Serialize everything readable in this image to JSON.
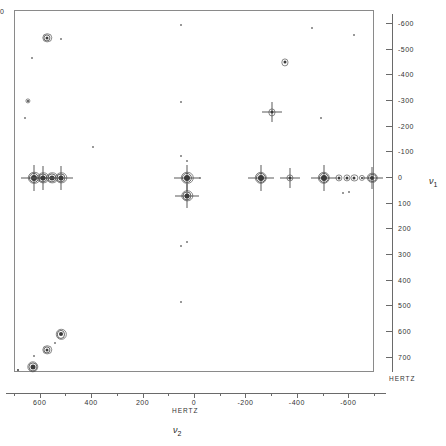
{
  "figure": {
    "type": "2d-nmr-contour-plot",
    "hertz_label_x": "HERTZ",
    "hertz_label_y": "HERTZ",
    "edge_label": "0",
    "axis_var_x": "ν",
    "axis_var_x_sub": "2",
    "axis_var_y": "ν",
    "axis_var_y_sub": "1"
  },
  "chart_data": {
    "type": "scatter",
    "title": "",
    "xlabel": "ν2 (HERTZ)",
    "ylabel": "ν1 (HERTZ)",
    "grid": false,
    "legend": "none",
    "xlim": [
      700,
      -700
    ],
    "ylim": [
      -650,
      760
    ],
    "x_ticks_major": [
      600,
      400,
      200,
      0,
      -200,
      -400,
      -600
    ],
    "x_tick_labels": [
      "600",
      "400",
      "200",
      "0",
      "-200",
      "-400",
      "-600"
    ],
    "x_ticks_minor": [
      700,
      500,
      300,
      100,
      -100,
      -300,
      -500,
      -700
    ],
    "y_ticks_major": [
      -600,
      -500,
      -400,
      -300,
      -200,
      -100,
      0,
      100,
      200,
      300,
      400,
      500,
      600,
      700
    ],
    "y_tick_labels": [
      "-600",
      "-500",
      "-400",
      "-300",
      "-200",
      "-100",
      "0",
      "100",
      "200",
      "300",
      "400",
      "500",
      "600",
      "700"
    ],
    "points": [
      {
        "x": 575,
        "y": -545,
        "size": 5,
        "rings": 2,
        "spikes": false
      },
      {
        "x": 635,
        "y": -465,
        "size": 2,
        "rings": 0,
        "spikes": false
      },
      {
        "x": 520,
        "y": -540,
        "size": 2,
        "rings": 0,
        "spikes": false
      },
      {
        "x": 650,
        "y": -300,
        "size": 3,
        "rings": 1,
        "spikes": false
      },
      {
        "x": 660,
        "y": -235,
        "size": 2,
        "rings": 0,
        "spikes": false
      },
      {
        "x": -455,
        "y": -585,
        "size": 2,
        "rings": 0,
        "spikes": false
      },
      {
        "x": -620,
        "y": -555,
        "size": 2,
        "rings": 0,
        "spikes": false
      },
      {
        "x": -350,
        "y": -450,
        "size": 5,
        "rings": 1,
        "spikes": false
      },
      {
        "x": -300,
        "y": -255,
        "size": 5,
        "rings": 1,
        "spikes": true
      },
      {
        "x": -490,
        "y": -235,
        "size": 2,
        "rings": 0,
        "spikes": false
      },
      {
        "x": 55,
        "y": -595,
        "size": 2,
        "rings": 0,
        "spikes": false
      },
      {
        "x": 55,
        "y": -295,
        "size": 2,
        "rings": 0,
        "spikes": false
      },
      {
        "x": 395,
        "y": -120,
        "size": 2,
        "rings": 0,
        "spikes": false
      },
      {
        "x": 55,
        "y": -85,
        "size": 2,
        "rings": 0,
        "spikes": false
      },
      {
        "x": 625,
        "y": 0,
        "size": 8,
        "rings": 2,
        "spikes": true
      },
      {
        "x": 590,
        "y": 0,
        "size": 7,
        "rings": 2,
        "spikes": true
      },
      {
        "x": 555,
        "y": 0,
        "size": 7,
        "rings": 2,
        "spikes": false
      },
      {
        "x": 520,
        "y": 0,
        "size": 7,
        "rings": 2,
        "spikes": true
      },
      {
        "x": 30,
        "y": 0,
        "size": 8,
        "rings": 2,
        "spikes": true
      },
      {
        "x": 30,
        "y": 70,
        "size": 7,
        "rings": 2,
        "spikes": true
      },
      {
        "x": 30,
        "y": -65,
        "size": 2,
        "rings": 0,
        "spikes": false
      },
      {
        "x": -20,
        "y": 0,
        "size": 2,
        "rings": 0,
        "spikes": false
      },
      {
        "x": -255,
        "y": 0,
        "size": 8,
        "rings": 2,
        "spikes": true
      },
      {
        "x": -370,
        "y": 0,
        "size": 5,
        "rings": 1,
        "spikes": true
      },
      {
        "x": -500,
        "y": 0,
        "size": 8,
        "rings": 2,
        "spikes": true
      },
      {
        "x": -560,
        "y": 0,
        "size": 5,
        "rings": 1,
        "spikes": false
      },
      {
        "x": -590,
        "y": 0,
        "size": 5,
        "rings": 1,
        "spikes": false
      },
      {
        "x": -620,
        "y": 0,
        "size": 5,
        "rings": 1,
        "spikes": false
      },
      {
        "x": -650,
        "y": 0,
        "size": 4,
        "rings": 1,
        "spikes": false
      },
      {
        "x": -690,
        "y": 0,
        "size": 6,
        "rings": 2,
        "spikes": true
      },
      {
        "x": -600,
        "y": 55,
        "size": 2,
        "rings": 0,
        "spikes": false
      },
      {
        "x": -575,
        "y": 60,
        "size": 2,
        "rings": 0,
        "spikes": false
      },
      {
        "x": 30,
        "y": 250,
        "size": 2,
        "rings": 0,
        "spikes": false
      },
      {
        "x": 55,
        "y": 265,
        "size": 2,
        "rings": 0,
        "spikes": false
      },
      {
        "x": 55,
        "y": 485,
        "size": 2,
        "rings": 0,
        "spikes": false
      },
      {
        "x": 520,
        "y": 610,
        "size": 6,
        "rings": 2,
        "spikes": false
      },
      {
        "x": 575,
        "y": 670,
        "size": 5,
        "rings": 2,
        "spikes": false
      },
      {
        "x": 545,
        "y": 645,
        "size": 2,
        "rings": 0,
        "spikes": false
      },
      {
        "x": 625,
        "y": 695,
        "size": 2,
        "rings": 0,
        "spikes": false
      },
      {
        "x": 630,
        "y": 735,
        "size": 7,
        "rings": 2,
        "spikes": false
      },
      {
        "x": 690,
        "y": 750,
        "size": 4,
        "rings": 0,
        "spikes": false
      }
    ]
  }
}
